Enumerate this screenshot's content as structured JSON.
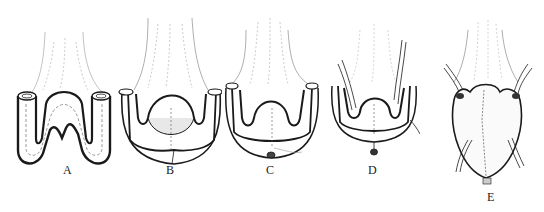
{
  "figure": {
    "panels": [
      {
        "label": "A"
      },
      {
        "label": "B"
      },
      {
        "label": "C"
      },
      {
        "label": "D"
      },
      {
        "label": "E"
      }
    ],
    "colors": {
      "ink": "#1a1a1a",
      "faint_ink": "#8a8a8a",
      "background": "#ffffff"
    }
  }
}
